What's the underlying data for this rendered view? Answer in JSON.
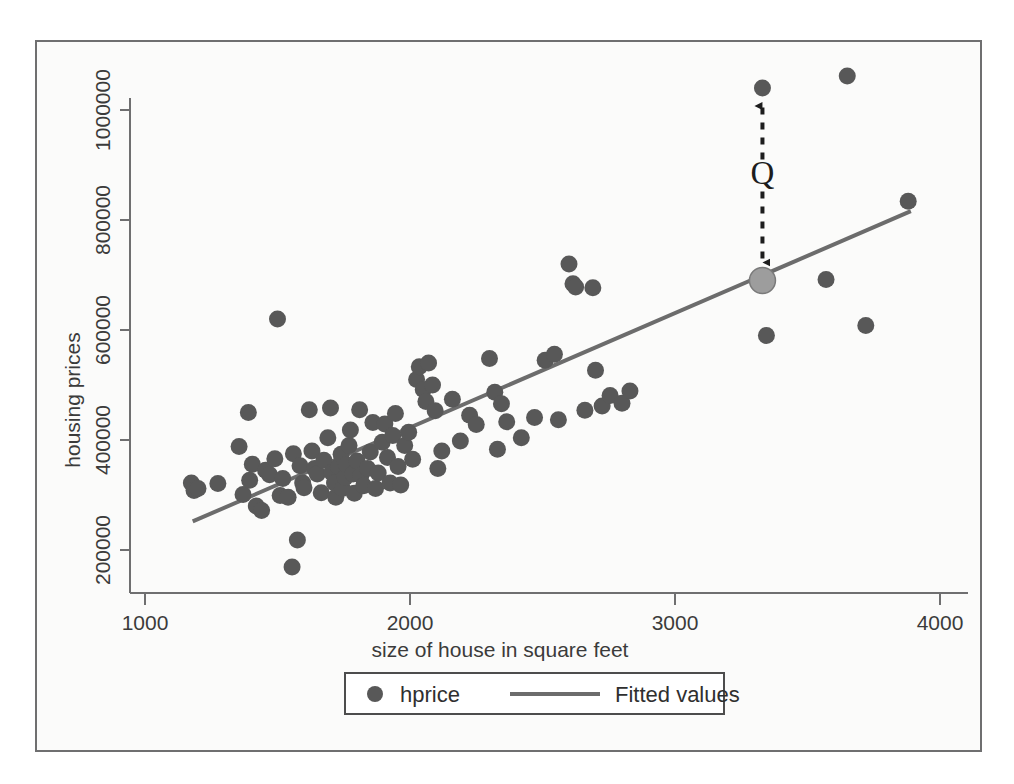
{
  "chart_data": {
    "type": "scatter",
    "title": "",
    "xlabel": "size of house in square feet",
    "ylabel": "housing prices",
    "xlim": [
      1030,
      3960
    ],
    "ylim": [
      145000,
      1090000
    ],
    "xticks": [
      1000,
      2000,
      3000,
      4000
    ],
    "xtick_labels": [
      "1000",
      "2000",
      "3000",
      "4000"
    ],
    "yticks": [
      200000,
      400000,
      600000,
      800000,
      1000000
    ],
    "ytick_labels": [
      "200000",
      "400000",
      "600000",
      "800000",
      "1000000"
    ],
    "grid": false,
    "legend_position": "below-plot",
    "legend": [
      {
        "label": "hprice",
        "marker": "circle",
        "color": "#585858"
      },
      {
        "label": "Fitted values",
        "marker": "line",
        "color": "#6c6c6c"
      }
    ],
    "series": [
      {
        "name": "hprice",
        "type": "scatter",
        "marker": "circle",
        "color": "#585858",
        "points": [
          [
            1175,
            322000
          ],
          [
            1185,
            308000
          ],
          [
            1200,
            312000
          ],
          [
            1275,
            321000
          ],
          [
            1390,
            450000
          ],
          [
            1355,
            388000
          ],
          [
            1370,
            301000
          ],
          [
            1395,
            327000
          ],
          [
            1405,
            356000
          ],
          [
            1420,
            280000
          ],
          [
            1440,
            272000
          ],
          [
            1455,
            345000
          ],
          [
            1470,
            337000
          ],
          [
            1500,
            620000
          ],
          [
            1490,
            366000
          ],
          [
            1510,
            299000
          ],
          [
            1520,
            330000
          ],
          [
            1540,
            296000
          ],
          [
            1555,
            169000
          ],
          [
            1560,
            375000
          ],
          [
            1575,
            218000
          ],
          [
            1585,
            353000
          ],
          [
            1595,
            322000
          ],
          [
            1600,
            313000
          ],
          [
            1620,
            455000
          ],
          [
            1630,
            380000
          ],
          [
            1640,
            348000
          ],
          [
            1650,
            338000
          ],
          [
            1665,
            304000
          ],
          [
            1675,
            363000
          ],
          [
            1690,
            404000
          ],
          [
            1700,
            458000
          ],
          [
            1705,
            341000
          ],
          [
            1715,
            322000
          ],
          [
            1720,
            296000
          ],
          [
            1730,
            352000
          ],
          [
            1740,
            374000
          ],
          [
            1745,
            312000
          ],
          [
            1755,
            332000
          ],
          [
            1760,
            355000
          ],
          [
            1770,
            390000
          ],
          [
            1775,
            418000
          ],
          [
            1785,
            338000
          ],
          [
            1790,
            303000
          ],
          [
            1800,
            362000
          ],
          [
            1810,
            455000
          ],
          [
            1815,
            336000
          ],
          [
            1825,
            317000
          ],
          [
            1840,
            348000
          ],
          [
            1850,
            378000
          ],
          [
            1860,
            432000
          ],
          [
            1870,
            312000
          ],
          [
            1880,
            340000
          ],
          [
            1895,
            396000
          ],
          [
            1905,
            429000
          ],
          [
            1915,
            368000
          ],
          [
            1925,
            322000
          ],
          [
            1935,
            408000
          ],
          [
            1945,
            448000
          ],
          [
            1955,
            352000
          ],
          [
            1965,
            318000
          ],
          [
            1980,
            390000
          ],
          [
            1995,
            414000
          ],
          [
            2010,
            365000
          ],
          [
            2025,
            510000
          ],
          [
            2035,
            533000
          ],
          [
            2050,
            492000
          ],
          [
            2060,
            470000
          ],
          [
            2070,
            540000
          ],
          [
            2085,
            500000
          ],
          [
            2095,
            453000
          ],
          [
            2105,
            348000
          ],
          [
            2120,
            380000
          ],
          [
            2160,
            474000
          ],
          [
            2190,
            398000
          ],
          [
            2225,
            445000
          ],
          [
            2250,
            428000
          ],
          [
            2300,
            548000
          ],
          [
            2320,
            487000
          ],
          [
            2330,
            383000
          ],
          [
            2345,
            466000
          ],
          [
            2365,
            433000
          ],
          [
            2420,
            404000
          ],
          [
            2470,
            441000
          ],
          [
            2510,
            545000
          ],
          [
            2545,
            556000
          ],
          [
            2560,
            437000
          ],
          [
            2600,
            720000
          ],
          [
            2615,
            684000
          ],
          [
            2625,
            678000
          ],
          [
            2660,
            454000
          ],
          [
            2690,
            677000
          ],
          [
            2700,
            527000
          ],
          [
            2725,
            462000
          ],
          [
            2755,
            481000
          ],
          [
            2800,
            467000
          ],
          [
            2830,
            489000
          ],
          [
            3330,
            1040000
          ],
          [
            3345,
            590000
          ],
          [
            3570,
            692000
          ],
          [
            3650,
            1062000
          ],
          [
            3720,
            608000
          ],
          [
            3880,
            834000
          ]
        ]
      },
      {
        "name": "Fitted values",
        "type": "line",
        "color": "#6c6c6c",
        "endpoints": [
          [
            1180,
            252000
          ],
          [
            3890,
            816000
          ]
        ]
      }
    ],
    "annotations": [
      {
        "text": "Q",
        "type": "double-arrow-residual",
        "x": 3330,
        "from_y": 690000,
        "to_y": 1040000,
        "label_y": 870000,
        "point_color": "#585858",
        "fitted_point_color": "#9d9d9d"
      }
    ]
  },
  "axes": {
    "y_title": "housing prices",
    "x_title": "size of house in square feet"
  },
  "legend": {
    "item1_label": "hprice",
    "item2_label": "Fitted values"
  },
  "annotation": {
    "q_label": "Q"
  },
  "colors": {
    "point": "#585858",
    "line": "#6c6c6c",
    "fitted_marker": "#9d9d9d",
    "axis": "#6f6f70",
    "text": "#3b3b3b",
    "background": "#fbfbfa"
  }
}
